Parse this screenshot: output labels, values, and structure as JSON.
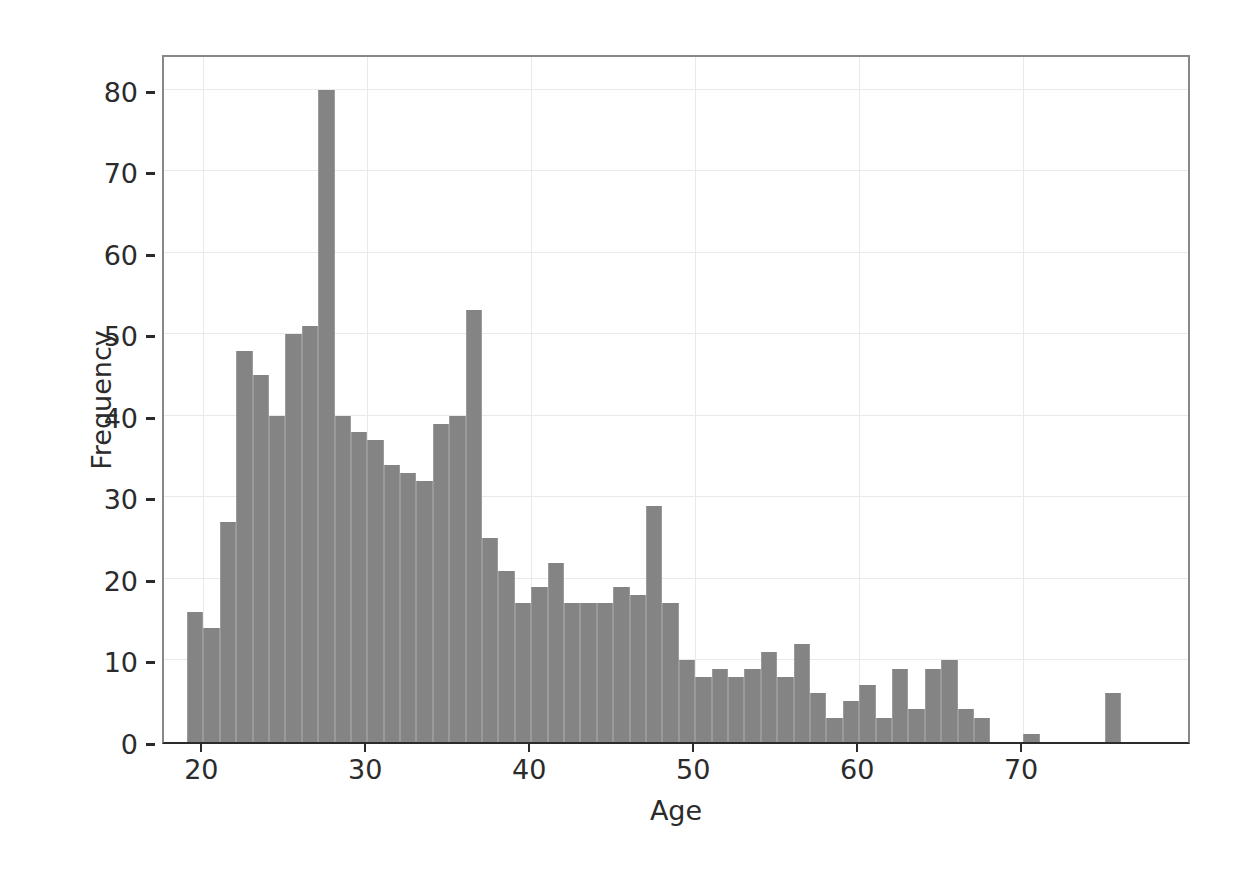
{
  "chart_data": {
    "type": "bar",
    "title": "",
    "subtitle": "",
    "xlabel": "Age",
    "ylabel": "Frequency",
    "xlim": [
      17.6,
      80.3
    ],
    "ylim": [
      0,
      84.5
    ],
    "grid": true,
    "legend": null,
    "xticks": [
      20,
      30,
      40,
      50,
      60,
      70
    ],
    "yticks": [
      0,
      10,
      20,
      30,
      40,
      50,
      60,
      70,
      80
    ],
    "bin_width": 1,
    "bar_color": "#848484",
    "background_color": "#ffffff",
    "grid_color": "#e9e9e9",
    "axis_color": "#2b2b2b",
    "categories": [
      19,
      20,
      21,
      22,
      23,
      24,
      25,
      26,
      27,
      28,
      29,
      30,
      31,
      32,
      33,
      34,
      35,
      36,
      37,
      38,
      39,
      40,
      41,
      42,
      43,
      44,
      45,
      46,
      47,
      48,
      49,
      50,
      51,
      52,
      53,
      54,
      55,
      56,
      57,
      58,
      59,
      60,
      61,
      62,
      63,
      64,
      65,
      66,
      67,
      70,
      75
    ],
    "values": [
      16,
      14,
      27,
      48,
      45,
      40,
      50,
      51,
      80,
      40,
      38,
      37,
      34,
      33,
      32,
      39,
      40,
      53,
      25,
      21,
      17,
      19,
      22,
      17,
      17,
      17,
      19,
      18,
      29,
      17,
      10,
      8,
      9,
      8,
      9,
      11,
      8,
      12,
      6,
      3,
      5,
      7,
      3,
      9,
      4,
      9,
      10,
      4,
      3,
      1,
      6
    ]
  },
  "axes": {
    "y_tick_labels": [
      "0",
      "10",
      "20",
      "30",
      "40",
      "50",
      "60",
      "70",
      "80"
    ],
    "x_tick_labels": [
      "20",
      "30",
      "40",
      "50",
      "60",
      "70"
    ],
    "y_axis_title": "Frequency",
    "x_axis_title": "Age"
  }
}
